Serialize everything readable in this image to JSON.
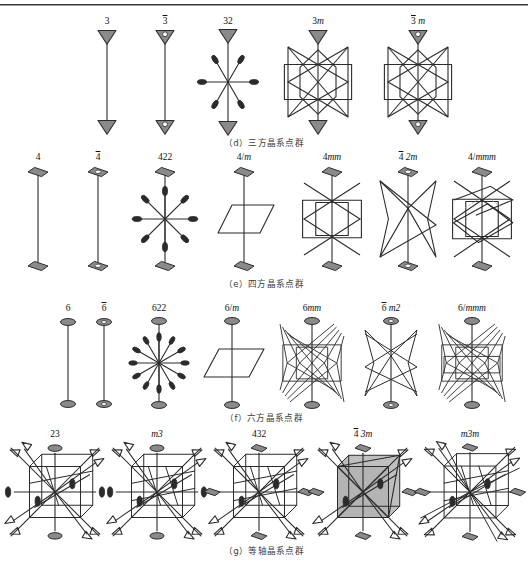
{
  "figure": {
    "title_rule": true,
    "colors": {
      "stroke": "#2b2b2b",
      "symbol_fill": "#8a8a8a",
      "symbol_fill_light": "#b9b9b9",
      "shade_fill": "#b4b4b4",
      "background": "#ffffff",
      "text": "#111111"
    }
  },
  "rows": [
    {
      "id": "trigonal",
      "caption": "（d）三方晶系点群",
      "items": [
        {
          "label": "3",
          "overline": false,
          "italic_tail": "",
          "type": "axis3",
          "x": 62,
          "w": 90
        },
        {
          "label": "3",
          "overline": true,
          "italic_tail": "",
          "type": "axis3bar",
          "x": 120,
          "w": 90
        },
        {
          "label": "32",
          "overline": false,
          "italic_tail": "",
          "type": "trig32",
          "x": 178,
          "w": 100
        },
        {
          "label": "3",
          "overline": false,
          "italic_tail": "m",
          "type": "trig3m",
          "x": 258,
          "w": 120
        },
        {
          "label": "3",
          "overline": true,
          "italic_tail": "m",
          "type": "trig3barm",
          "x": 358,
          "w": 120
        }
      ]
    },
    {
      "id": "tetragonal",
      "caption": "（e）四方晶系点群",
      "items": [
        {
          "label": "4",
          "overline": false,
          "italic_tail": "",
          "type": "axis4",
          "x": 8,
          "w": 60
        },
        {
          "label": "4",
          "overline": true,
          "italic_tail": "",
          "type": "axis4bar",
          "x": 68,
          "w": 60
        },
        {
          "label": "422",
          "overline": false,
          "italic_tail": "",
          "type": "tet422",
          "x": 120,
          "w": 90
        },
        {
          "label": "4/",
          "overline": false,
          "italic_tail": "m",
          "type": "tet4m",
          "x": 196,
          "w": 96
        },
        {
          "label": "4",
          "overline": false,
          "italic_tail": "mm",
          "type": "tet4mm",
          "x": 286,
          "w": 92
        },
        {
          "label": "4",
          "overline": true,
          "italic_tail": "2m",
          "type": "tet42barm",
          "x": 362,
          "w": 92
        },
        {
          "label": "4/",
          "overline": false,
          "italic_tail": "mmm",
          "type": "tet4mmm",
          "x": 436,
          "w": 92
        }
      ]
    },
    {
      "id": "hexagonal",
      "caption": "（f）六方晶系点群",
      "items": [
        {
          "label": "6",
          "overline": false,
          "italic_tail": "",
          "type": "axis6",
          "x": 40,
          "w": 56
        },
        {
          "label": "6",
          "overline": true,
          "italic_tail": "",
          "type": "axis6bar",
          "x": 76,
          "w": 56
        },
        {
          "label": "622",
          "overline": false,
          "italic_tail": "",
          "type": "hex622",
          "x": 116,
          "w": 86
        },
        {
          "label": "6/",
          "overline": false,
          "italic_tail": "m",
          "type": "hex6m",
          "x": 186,
          "w": 92
        },
        {
          "label": "6",
          "overline": false,
          "italic_tail": "mm",
          "type": "hex6mm",
          "x": 266,
          "w": 92
        },
        {
          "label": "6",
          "overline": true,
          "italic_tail": "m2",
          "type": "hex6barm2",
          "x": 346,
          "w": 90
        },
        {
          "label": "6/",
          "overline": false,
          "italic_tail": "mmm",
          "type": "hex6mmm",
          "x": 424,
          "w": 96
        }
      ]
    },
    {
      "id": "cubic",
      "caption": "（g）等轴晶系点群",
      "items": [
        {
          "label": "23",
          "overline": false,
          "italic_tail": "",
          "type": "cub23",
          "x": 4,
          "w": 102
        },
        {
          "label": "",
          "overline": false,
          "italic_tail": "m3",
          "type": "cubm3",
          "x": 106,
          "w": 102
        },
        {
          "label": "432",
          "overline": false,
          "italic_tail": "",
          "type": "cub432",
          "x": 208,
          "w": 102
        },
        {
          "label": "4",
          "overline": true,
          "italic_tail": "3m",
          "type": "cub4bar3m",
          "x": 312,
          "w": 102
        },
        {
          "label": "",
          "overline": false,
          "italic_tail": "m3m",
          "type": "cubm3m",
          "x": 416,
          "w": 108
        }
      ]
    }
  ]
}
